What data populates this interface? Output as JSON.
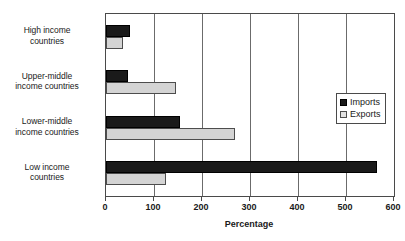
{
  "chart_data": {
    "type": "bar",
    "orientation": "horizontal",
    "title": "",
    "xlabel": "Percentage",
    "ylabel": "",
    "xlim": [
      0,
      600
    ],
    "xticks": [
      0,
      100,
      200,
      300,
      400,
      500,
      600
    ],
    "xtick_labels": [
      "0",
      "100",
      "200",
      "300",
      "400",
      "500",
      "600"
    ],
    "grid": true,
    "grid_axis": "x",
    "legend_position": "right",
    "categories": [
      "High income countries",
      "Upper-middle income countries",
      "Lower-middle income countries",
      "Low income countries"
    ],
    "category_lines": [
      [
        "High income",
        "countries"
      ],
      [
        "Upper-middle",
        "income countries"
      ],
      [
        "Lower-middle",
        "income countries"
      ],
      [
        "Low income",
        "countries"
      ]
    ],
    "series": [
      {
        "name": "Imports",
        "color": "#1a1a1a",
        "values": [
          50,
          45,
          155,
          565
        ]
      },
      {
        "name": "Exports",
        "color": "#d4d4d4",
        "values": [
          35,
          145,
          268,
          125
        ]
      }
    ]
  },
  "legend": {
    "items": [
      {
        "label": "Imports",
        "swatch": "imports-swatch"
      },
      {
        "label": "Exports",
        "swatch": "exports-swatch"
      }
    ]
  },
  "axis": {
    "x_title": "Percentage"
  },
  "colors": {
    "imports": "#1a1a1a",
    "exports": "#d4d4d4",
    "axis": "#4a4a4a",
    "grid": "#6b6b6b",
    "background": "#ffffff"
  }
}
